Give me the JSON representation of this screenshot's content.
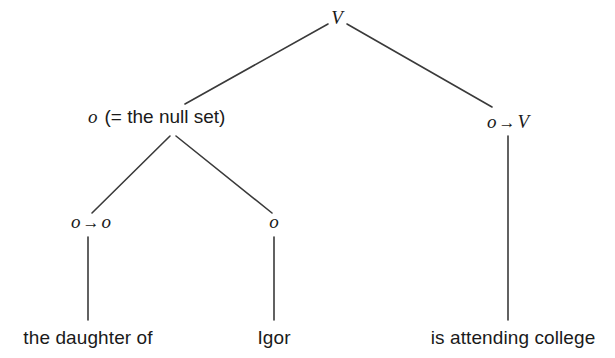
{
  "diagram": {
    "type": "syntactic-category-tree",
    "title": "",
    "background_color": "#ffffff",
    "text_color": "#1a1a1a",
    "nodes": {
      "root": {
        "label": "V",
        "x": 337,
        "y": 16
      },
      "null_set": {
        "category": "o",
        "gloss": "(= the null set)",
        "x": 92,
        "y": 117
      },
      "right_branch": {
        "left": "o",
        "arrow": "→",
        "right": "V",
        "x": 508,
        "y": 122
      },
      "lower_left": {
        "left": "o",
        "arrow": "→",
        "right": "o",
        "x": 88,
        "y": 222
      },
      "lower_mid": {
        "label": "o",
        "x": 274,
        "y": 222
      }
    },
    "terminals": [
      {
        "text": "the daughter of",
        "x": 88,
        "y": 340
      },
      {
        "text": "Igor",
        "x": 274,
        "y": 340
      },
      {
        "text": "is attending college",
        "x": 508,
        "y": 340
      }
    ],
    "edges": [
      {
        "name": "root-to-null-set",
        "x1": 328,
        "y1": 24,
        "x2": 185,
        "y2": 104
      },
      {
        "name": "root-to-right-branch",
        "x1": 347,
        "y1": 24,
        "x2": 492,
        "y2": 107
      },
      {
        "name": "null-set-to-lower-left",
        "x1": 170,
        "y1": 136,
        "x2": 92,
        "y2": 213
      },
      {
        "name": "null-set-to-lower-mid",
        "x1": 176,
        "y1": 136,
        "x2": 272,
        "y2": 213
      },
      {
        "name": "lower-left-to-terminal",
        "x1": 88,
        "y1": 237,
        "x2": 88,
        "y2": 320
      },
      {
        "name": "lower-mid-to-terminal",
        "x1": 274,
        "y1": 237,
        "x2": 274,
        "y2": 320
      },
      {
        "name": "right-branch-to-terminal",
        "x1": 508,
        "y1": 136,
        "x2": 508,
        "y2": 320
      }
    ],
    "edge_color": "#3a3a3a",
    "edge_width": 1.6
  }
}
